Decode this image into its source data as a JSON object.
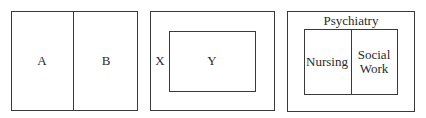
{
  "diagrams": [
    {
      "id": "side-by-side",
      "labels": {
        "left": "A",
        "right": "B"
      }
    },
    {
      "id": "nested",
      "labels": {
        "outer": "X",
        "inner": "Y"
      }
    },
    {
      "id": "nested-split",
      "labels": {
        "outer": "Psychiatry",
        "inner_left": "Nursing",
        "inner_right_line1": "Social",
        "inner_right_line2": "Work"
      }
    }
  ],
  "colors": {
    "line": "#3a3a3a",
    "text": "#2a2a2a",
    "background": "#ffffff"
  }
}
